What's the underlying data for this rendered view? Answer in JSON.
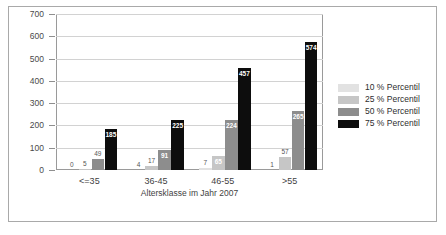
{
  "chart_data": {
    "type": "bar",
    "title": "",
    "xlabel": "Altersklasse im Jahr 2007",
    "ylabel": "in Tausend Euro",
    "categories": [
      "<=35",
      "36-45",
      "46-55",
      ">55"
    ],
    "series": [
      {
        "name": "10 % Percentil",
        "color": "#e2e2e2",
        "values": [
          0,
          4,
          7,
          1
        ]
      },
      {
        "name": "25 % Percentil",
        "color": "#c6c6c6",
        "values": [
          5,
          17,
          65,
          57
        ]
      },
      {
        "name": "50 % Percentil",
        "color": "#8d8d8d",
        "values": [
          49,
          91,
          224,
          265
        ]
      },
      {
        "name": "75 % Percentil",
        "color": "#0d0d0d",
        "values": [
          185,
          225,
          457,
          574
        ]
      }
    ],
    "ylim": [
      0,
      700
    ],
    "yticks": [
      0,
      100,
      200,
      300,
      400,
      500,
      600,
      700
    ],
    "ytick_labels": [
      "0",
      "100",
      "200",
      "300",
      "400",
      "500",
      "600",
      "700"
    ],
    "grid": true,
    "legend_position": "right",
    "legend_entries": [
      "10 % Percentil",
      "25 % Percentil",
      "50 % Percentil",
      "75 % Percentil"
    ],
    "data_labels": [
      [
        "0",
        "5",
        "49",
        "185"
      ],
      [
        "4",
        "17",
        "91",
        "225"
      ],
      [
        "7",
        "65",
        "224",
        "457"
      ],
      [
        "1",
        "57",
        "265",
        "574"
      ]
    ]
  },
  "colors": {
    "frame": "#a9a9a9",
    "grid": "#d2d2d2",
    "axis": "#9a9a9a",
    "text": "#3a3a3a",
    "background": "#ffffff"
  }
}
